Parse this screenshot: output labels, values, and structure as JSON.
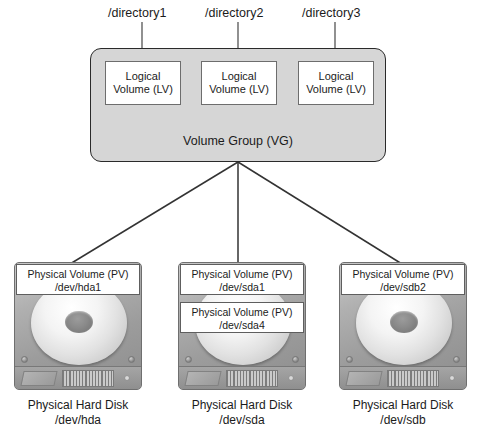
{
  "diagram": {
    "directories": [
      {
        "label": "/directory1"
      },
      {
        "label": "/directory2"
      },
      {
        "label": "/directory3"
      }
    ],
    "volume_group": {
      "label": "Volume Group (VG)",
      "fill_color": "#d6d6d6",
      "border_color": "#2a2a2a",
      "logical_volumes": [
        {
          "line1": "Logical",
          "line2": "Volume (LV)"
        },
        {
          "line1": "Logical",
          "line2": "Volume (LV)"
        },
        {
          "line1": "Logical",
          "line2": "Volume (LV)"
        }
      ]
    },
    "disks": [
      {
        "device_caption_line1": "Physical Hard Disk",
        "device_caption_line2": "/dev/hda",
        "physical_volumes": [
          {
            "line1": "Physical Volume (PV)",
            "line2": "/dev/hda1"
          }
        ]
      },
      {
        "device_caption_line1": "Physical Hard Disk",
        "device_caption_line2": "/dev/sda",
        "physical_volumes": [
          {
            "line1": "Physical Volume (PV)",
            "line2": "/dev/sda1"
          },
          {
            "line1": "Physical Volume (PV)",
            "line2": "/dev/sda4"
          }
        ]
      },
      {
        "device_caption_line1": "Physical Hard Disk",
        "device_caption_line2": "/dev/sdb",
        "physical_volumes": [
          {
            "line1": "Physical Volume (PV)",
            "line2": "/dev/sdb2"
          }
        ]
      }
    ],
    "connector_color": "#333333"
  }
}
